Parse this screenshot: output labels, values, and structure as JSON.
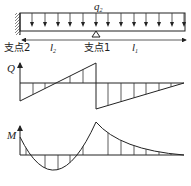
{
  "diagram": {
    "load_label": "q",
    "load_sub": "2",
    "support2_label": "支点2",
    "support1_label": "支点1",
    "span_l2_label": "l",
    "span_l2_sub": "2",
    "span_l1_label": "l",
    "span_l1_sub": "1",
    "shear_axis_label": "Q",
    "moment_axis_label": "M"
  },
  "beam": {
    "left_x": 20,
    "right_x": 185,
    "top_y": 13,
    "bottom_y": 31,
    "load_arrow_x": [
      32,
      45,
      58,
      70,
      83,
      96,
      108,
      121,
      134,
      146,
      159,
      172,
      184
    ],
    "support1_x": 96
  },
  "shear_diagram": {
    "baseline_y": 83,
    "points": [
      [
        20,
        101
      ],
      [
        96,
        63
      ],
      [
        96,
        109
      ],
      [
        184,
        83
      ]
    ],
    "hatch_x": [
      33,
      45,
      70,
      83,
      108,
      121,
      134,
      146,
      159,
      171
    ]
  },
  "moment_diagram": {
    "baseline_y": 155,
    "hatch_x": [
      26,
      45,
      58,
      70,
      83,
      108,
      121,
      134,
      146,
      159,
      171
    ]
  }
}
